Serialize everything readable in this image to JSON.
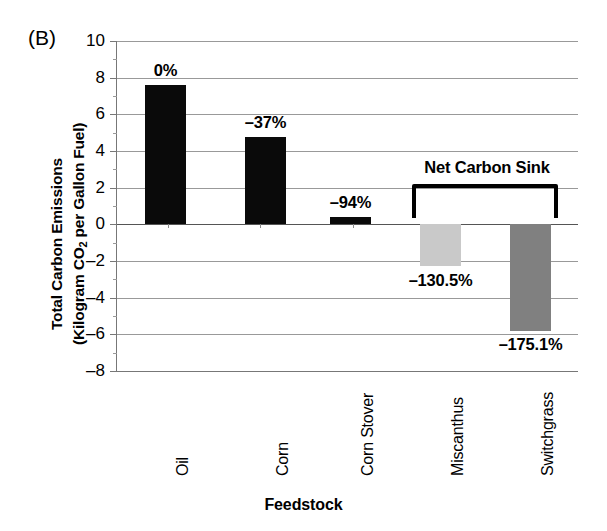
{
  "panel": {
    "label": "(B)"
  },
  "chart_data": {
    "type": "bar",
    "title": "",
    "panel_label": "(B)",
    "categories": [
      "Oil",
      "Corn",
      "Corn Stover",
      "Miscanthus",
      "Switchgrass"
    ],
    "values": [
      7.6,
      4.75,
      0.4,
      -2.3,
      -5.8
    ],
    "data_labels": [
      "0%",
      "–37%",
      "–94%",
      "–130.5%",
      "–175.1%"
    ],
    "bar_colors": [
      "#0a0a0a",
      "#0a0a0a",
      "#0a0a0a",
      "#c9c9c9",
      "#808080"
    ],
    "xlabel": "Feedstock",
    "ylabel": "Total Carbon Emissions (Kilogram CO2 per Gallon Fuel)",
    "ylabel_line1": "Total Carbon Emissions",
    "ylabel_line2_pre": "(Kilogram CO",
    "ylabel_line2_sub": "2",
    "ylabel_line2_post": " per Gallon Fuel)",
    "ylim": [
      -8,
      10
    ],
    "ytick_labels": [
      "10",
      "8",
      "6",
      "4",
      "2",
      "0",
      "–2",
      "–4",
      "–6",
      "–8"
    ],
    "ytick_values": [
      10,
      8,
      6,
      4,
      2,
      0,
      -2,
      -4,
      -6,
      -8
    ],
    "grid": true,
    "legend": "none",
    "annotations": [
      {
        "text": "Net Carbon Sink",
        "spans_categories": [
          "Miscanthus",
          "Switchgrass"
        ],
        "style": "bracket"
      }
    ]
  },
  "colors": {
    "bar_fossil": "#0a0a0a",
    "bar_miscanthus": "#c9c9c9",
    "bar_switchgrass": "#808080",
    "gridline": "#999999",
    "axis": "#777777",
    "text": "#000000"
  }
}
